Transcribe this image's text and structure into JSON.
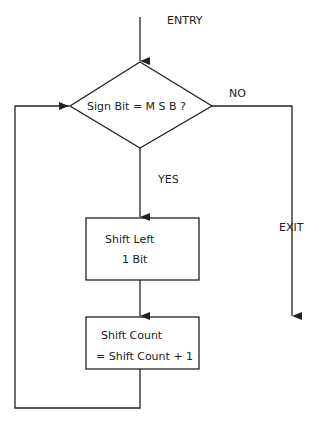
{
  "labels": {
    "entry": "ENTRY",
    "exit": "EXIT",
    "no": "NO",
    "yes": "YES"
  },
  "decision": {
    "text": "Sign Bit = M S B  ?"
  },
  "box1": {
    "line1": "Shift  Left",
    "line2": "1 Bit"
  },
  "box2": {
    "line1": "Shift  Count",
    "line2": "= Shift Count + 1"
  },
  "colors": {
    "line": "#222222"
  }
}
